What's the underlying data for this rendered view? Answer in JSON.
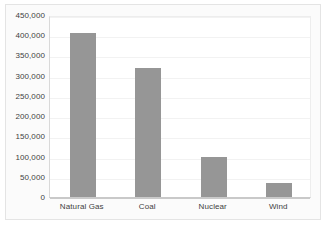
{
  "chart_data": {
    "type": "bar",
    "title": "",
    "subtitle": "",
    "xlabel": "",
    "ylabel": "",
    "categories": [
      "Natural Gas",
      "Coal",
      "Nuclear",
      "Wind"
    ],
    "values": [
      405000,
      318000,
      100000,
      35000
    ],
    "ylim": [
      0,
      450000
    ],
    "ytick_values": [
      0,
      50000,
      100000,
      150000,
      200000,
      250000,
      300000,
      350000,
      400000,
      450000
    ],
    "ytick_labels": [
      "0",
      "50,000",
      "100,000",
      "150,000",
      "200,000",
      "250,000",
      "300,000",
      "350,000",
      "400,000",
      "450,000"
    ],
    "grid": true,
    "grid_axis": "y",
    "legend": false,
    "legend_position": "none",
    "bar_color": "#969696",
    "plot_background": "#ffffff",
    "figure_background": "#fbfbfb",
    "gridline_color": "#f2f2f2",
    "axis_color": "#c9c9c9",
    "tick_label_color": "#3f3f3f"
  }
}
